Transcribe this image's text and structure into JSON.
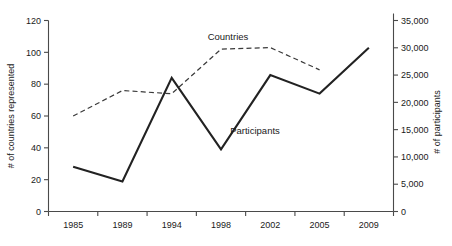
{
  "chart_data": {
    "type": "line",
    "title": "",
    "subtitle": "",
    "xlabel": "",
    "categories": [
      "1985",
      "1989",
      "1994",
      "1998",
      "2002",
      "2005",
      "2009"
    ],
    "grid": false,
    "legend_position": "inline-annotation",
    "axes": {
      "left": {
        "label": "# of countries represented",
        "ylim": [
          0,
          120
        ],
        "tick_step": 20,
        "ticks": [
          "0",
          "20",
          "40",
          "60",
          "80",
          "100",
          "120"
        ]
      },
      "right": {
        "label": "# of participants",
        "ylim": [
          0,
          35000
        ],
        "tick_step": 5000,
        "ticks": [
          "0",
          "5,000",
          "10,000",
          "15,000",
          "20,000",
          "25,000",
          "30,000",
          "35,000"
        ]
      }
    },
    "series": [
      {
        "name": "Countries",
        "axis": "left",
        "style": "dashed",
        "annotation": "Countries",
        "x": [
          "1985",
          "1989",
          "1994",
          "1998",
          "2002",
          "2005"
        ],
        "values": [
          60,
          76,
          74,
          102,
          103,
          89
        ]
      },
      {
        "name": "Participants",
        "axis": "right",
        "style": "solid",
        "annotation": "Participants",
        "x": [
          "1985",
          "1989",
          "1994",
          "1998",
          "2002",
          "2005",
          "2009"
        ],
        "values": [
          8200,
          5500,
          24500,
          11400,
          25000,
          21600,
          30000
        ]
      }
    ]
  }
}
